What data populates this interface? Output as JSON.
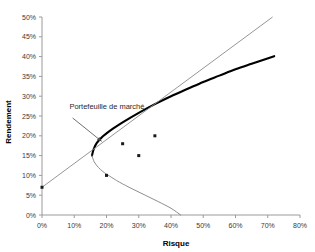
{
  "chart_data": {
    "type": "line",
    "title": "",
    "xlabel": "Risque",
    "ylabel": "Rendement",
    "xlim": [
      0,
      80
    ],
    "ylim": [
      0,
      50
    ],
    "grid": false,
    "legend": "none",
    "x_ticks": [
      "0%",
      "10%",
      "20%",
      "30%",
      "40%",
      "50%",
      "60%",
      "70%",
      "80%"
    ],
    "x_tick_values": [
      0,
      10,
      20,
      30,
      40,
      50,
      60,
      70,
      80
    ],
    "y_ticks": [
      "0%",
      "5%",
      "10%",
      "15%",
      "20%",
      "25%",
      "30%",
      "35%",
      "40%",
      "45%",
      "50%"
    ],
    "y_tick_values": [
      0,
      5,
      10,
      15,
      20,
      25,
      30,
      35,
      40,
      45,
      50
    ],
    "series": [
      {
        "name": "Frontiere efficiente",
        "style": "thick-black-curve",
        "color": "#000000",
        "points": [
          [
            15.5,
            15.0
          ],
          [
            16.0,
            16.6
          ],
          [
            17.0,
            18.2
          ],
          [
            18.5,
            19.6
          ],
          [
            20.0,
            20.6
          ],
          [
            22.0,
            21.8
          ],
          [
            25.0,
            23.4
          ],
          [
            30.0,
            25.8
          ],
          [
            35.0,
            28.0
          ],
          [
            40.0,
            30.0
          ],
          [
            45.0,
            31.8
          ],
          [
            50.0,
            33.6
          ],
          [
            55.0,
            35.2
          ],
          [
            60.0,
            36.8
          ],
          [
            65.0,
            38.2
          ],
          [
            72.0,
            40.1
          ]
        ]
      },
      {
        "name": "Branche inefficiente",
        "style": "thin-gray-curve",
        "color": "#808080",
        "points": [
          [
            15.5,
            15.0
          ],
          [
            16.2,
            13.4
          ],
          [
            17.5,
            12.0
          ],
          [
            19.0,
            10.9
          ],
          [
            21.0,
            9.8
          ],
          [
            24.0,
            8.3
          ],
          [
            28.0,
            6.6
          ],
          [
            32.0,
            5.0
          ],
          [
            36.0,
            3.4
          ],
          [
            40.0,
            1.7
          ],
          [
            43.0,
            0.0
          ]
        ]
      },
      {
        "name": "Droite de marche des capitaux",
        "style": "thin-gray-line",
        "color": "#8a8a8a",
        "points": [
          [
            0,
            7.0
          ],
          [
            71.5,
            50.0
          ]
        ]
      }
    ],
    "scatter": {
      "name": "Titres individuels",
      "color": "#1a1a1a",
      "points": [
        [
          0,
          7
        ],
        [
          20,
          10
        ],
        [
          25,
          18
        ],
        [
          30,
          15
        ],
        [
          35,
          20
        ]
      ]
    },
    "annotations": [
      {
        "text": "Portefeuille de marché",
        "label_x": 8.5,
        "label_y": 27.5,
        "arrow_from": [
          9.5,
          24.5
        ],
        "arrow_to": [
          18.5,
          18.6
        ]
      }
    ]
  },
  "axis": {
    "x_title": "Risque",
    "y_title": "Rendement"
  },
  "colors": {
    "axis": "#9a9a9a",
    "frontier": "#000000",
    "cml": "#8a8a8a",
    "inefficient": "#8a8a8a",
    "marker": "#1a1a1a",
    "text": "#2a2a2a"
  }
}
